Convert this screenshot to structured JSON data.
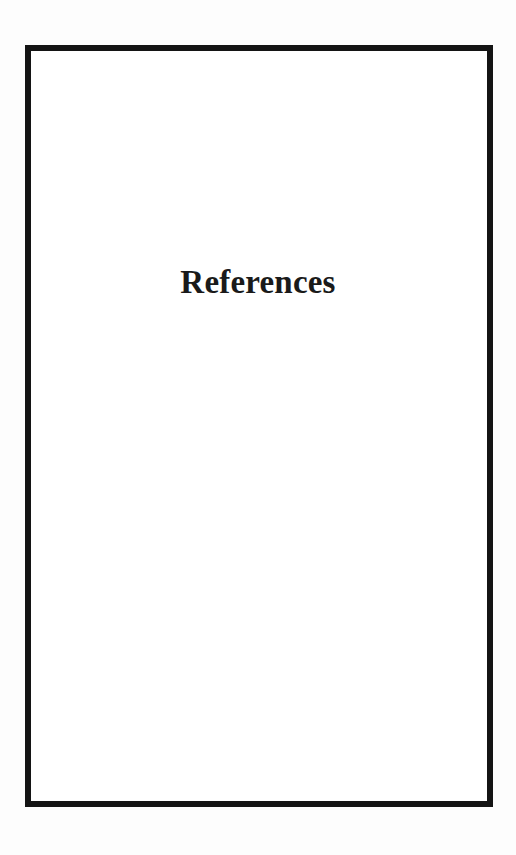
{
  "page": {
    "title": "References"
  },
  "colors": {
    "frame": "#141414",
    "text": "#1a1a1a",
    "background": "#ffffff"
  }
}
